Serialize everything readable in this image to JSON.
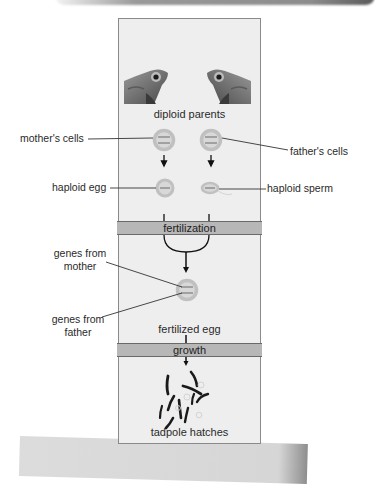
{
  "diagram": {
    "stages": {
      "parents": "diploid parents",
      "fertilization_bar": "fertilization",
      "zygote": "fertilized egg",
      "growth_bar": "growth",
      "offspring": "tadpole hatches"
    },
    "callouts": {
      "mothers_cells": "mother's cells",
      "fathers_cells": "father's cells",
      "haploid_egg": "haploid egg",
      "haploid_sperm": "haploid sperm",
      "genes_mother_line1": "genes from",
      "genes_mother_line2": "mother",
      "genes_father_line1": "genes from",
      "genes_father_line2": "father"
    },
    "icons": [
      "frog-left-icon",
      "frog-right-icon",
      "diploid-cell-icon",
      "haploid-egg-icon",
      "haploid-sperm-icon",
      "zygote-icon",
      "tadpoles-icon"
    ],
    "colors": {
      "panel_bg": "#eeeeee",
      "bar_bg": "#b7b7b7",
      "cell_ring": "#c4c4c4",
      "text": "#2a2a2a"
    }
  }
}
